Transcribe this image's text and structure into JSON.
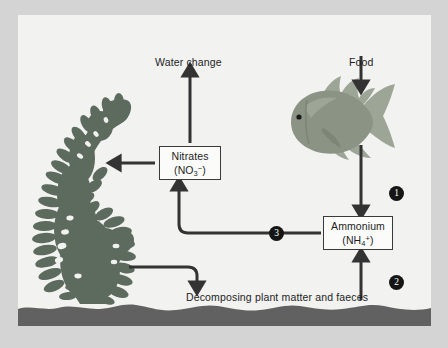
{
  "diagram": {
    "panel_background": "#f2f2f1",
    "outer_background": "#d4d4d4",
    "ink": "#333333",
    "labels": {
      "water_change": "Water change",
      "food": "Food",
      "decomposing": "Decomposing plant matter and faeces"
    },
    "boxes": [
      {
        "id": "nitrates",
        "name": "Nitrates",
        "formula_prefix": "(NO",
        "formula_sub": "3",
        "formula_sup": "−",
        "formula_suffix": ")"
      },
      {
        "id": "ammonium",
        "name": "Ammonium",
        "formula_prefix": "(NH",
        "formula_sub": "4",
        "formula_sup": "+",
        "formula_suffix": ")"
      }
    ],
    "steps": [
      {
        "id": "step-1",
        "number": "1"
      },
      {
        "id": "step-2",
        "number": "2"
      },
      {
        "id": "step-3",
        "number": "3"
      }
    ],
    "organisms": {
      "fish": {
        "name": "goldfish",
        "body_color": "#8b9484",
        "fin_color": "#9ca596"
      },
      "plant": {
        "name": "aquatic-plant",
        "color": "#5d6b5f"
      },
      "substrate": {
        "name": "gravel-substrate",
        "color": "#616161"
      }
    },
    "arrows": [
      {
        "id": "food-to-fish",
        "from": "Food",
        "to": "fish"
      },
      {
        "id": "fish-to-ammonium",
        "from": "fish",
        "to": "Ammonium",
        "step": "1"
      },
      {
        "id": "decomposing-to-ammonium",
        "from": "Decomposing plant matter and faeces",
        "to": "Ammonium",
        "step": "2"
      },
      {
        "id": "ammonium-to-nitrates",
        "from": "Ammonium",
        "to": "Nitrates",
        "step": "3"
      },
      {
        "id": "nitrates-to-water-change",
        "from": "Nitrates",
        "to": "Water change"
      },
      {
        "id": "nitrates-to-plant",
        "from": "Nitrates",
        "to": "plant"
      },
      {
        "id": "plant-to-decomposing",
        "from": "plant",
        "to": "Decomposing plant matter and faeces"
      }
    ]
  }
}
